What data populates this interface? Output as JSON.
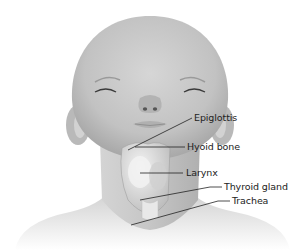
{
  "diagram": {
    "labels": [
      {
        "id": "epiglottis",
        "text": "Epiglottis"
      },
      {
        "id": "hyoid-bone",
        "text": "Hyoid bone"
      },
      {
        "id": "larynx",
        "text": "Larynx"
      },
      {
        "id": "thyroid-gland",
        "text": "Thyroid gland"
      },
      {
        "id": "trachea",
        "text": "Trachea"
      }
    ],
    "colors": {
      "skin": "#c9c9c9",
      "skin_shadow": "#a9a9a9",
      "organ": "#e4e4e4",
      "leader_line": "#222222",
      "text": "#222222"
    }
  }
}
